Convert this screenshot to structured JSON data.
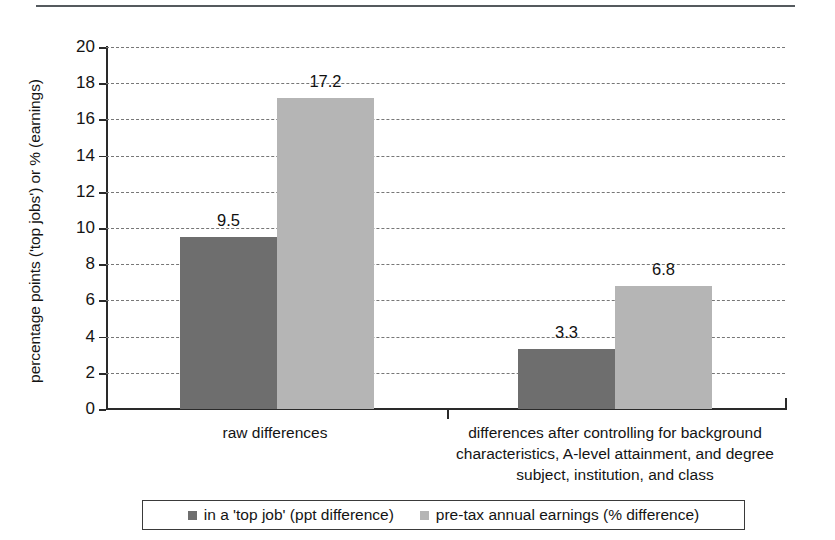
{
  "chart_data": {
    "type": "bar",
    "title": "",
    "subtitle": "",
    "xlabel": "",
    "ylabel": "percentage points ('top jobs') or % (earnings)",
    "ylim": [
      0,
      20
    ],
    "yticks": [
      0,
      2,
      4,
      6,
      8,
      10,
      12,
      14,
      16,
      18,
      20
    ],
    "ytick_labels": [
      "0",
      "2",
      "4",
      "6",
      "8",
      "10",
      "12",
      "14",
      "16",
      "18",
      "20"
    ],
    "grid": "horizontal-dashed",
    "legend_position": "bottom",
    "categories": [
      "raw differences",
      "differences after controlling for background characteristics, A-level attainment, and degree subject, institution, and class"
    ],
    "category_lines": [
      [
        "raw differences"
      ],
      [
        "differences after controlling for background",
        "characteristics, A-level attainment, and degree",
        "subject, institution, and class"
      ]
    ],
    "series": [
      {
        "name": "in a 'top job' (ppt difference)",
        "color": "#6e6e6e",
        "values": [
          9.5,
          3.3
        ],
        "value_labels": [
          "9.5",
          "3.3"
        ]
      },
      {
        "name": "pre-tax annual earnings (% difference)",
        "color": "#b5b5b5",
        "values": [
          17.2,
          6.8
        ],
        "value_labels": [
          "17.2",
          "6.8"
        ]
      }
    ]
  },
  "legend": {
    "items": [
      {
        "label": "in a 'top job' (ppt difference)",
        "swatch": "dark-gray-square"
      },
      {
        "label": "pre-tax annual earnings (% difference)",
        "swatch": "light-gray-square"
      }
    ]
  },
  "colors": {
    "series_dark": "#6e6e6e",
    "series_light": "#b5b5b5",
    "axis": "#2a2a2a",
    "gridline": "#777777",
    "text": "#141414",
    "page_rule": "#555a5e",
    "background": "#ffffff"
  }
}
